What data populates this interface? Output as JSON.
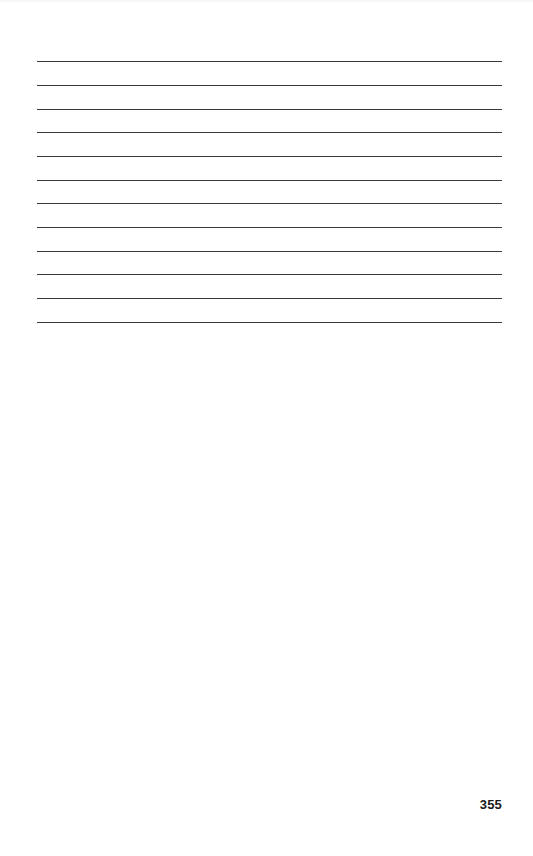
{
  "page": {
    "type": "notes-page",
    "ruled_line_count": 12,
    "ruled_lines": [
      {
        "index": 1,
        "y": 61
      },
      {
        "index": 2,
        "y": 85
      },
      {
        "index": 3,
        "y": 109
      },
      {
        "index": 4,
        "y": 132
      },
      {
        "index": 5,
        "y": 156
      },
      {
        "index": 6,
        "y": 180
      },
      {
        "index": 7,
        "y": 203
      },
      {
        "index": 8,
        "y": 227
      },
      {
        "index": 9,
        "y": 251
      },
      {
        "index": 10,
        "y": 274
      },
      {
        "index": 11,
        "y": 298
      },
      {
        "index": 12,
        "y": 322
      }
    ],
    "line_color": "#3a3a3a",
    "page_number": "355"
  }
}
